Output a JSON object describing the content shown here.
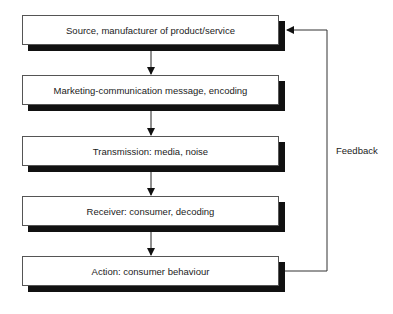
{
  "diagram": {
    "nodes": [
      {
        "id": "source",
        "label": "Source, manufacturer of product/service"
      },
      {
        "id": "message",
        "label": "Marketing-communication message, encoding"
      },
      {
        "id": "transmission",
        "label": "Transmission: media, noise"
      },
      {
        "id": "receiver",
        "label": "Receiver: consumer, decoding"
      },
      {
        "id": "action",
        "label": "Action: consumer behaviour"
      }
    ],
    "edges": [
      {
        "from": "source",
        "to": "message"
      },
      {
        "from": "message",
        "to": "transmission"
      },
      {
        "from": "transmission",
        "to": "receiver"
      },
      {
        "from": "receiver",
        "to": "action"
      },
      {
        "from": "action",
        "to": "source",
        "label": "Feedback"
      }
    ],
    "feedback_label": "Feedback"
  }
}
